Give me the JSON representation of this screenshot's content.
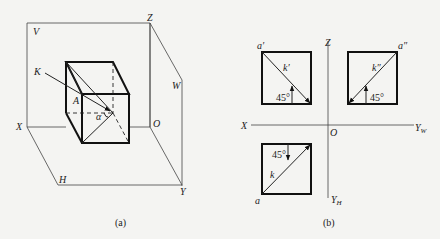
{
  "figure_a": {
    "caption": "(a)",
    "labels": {
      "V": "V",
      "Z": "Z",
      "W": "W",
      "K": "K",
      "A": "A",
      "alpha": "α",
      "X": "X",
      "O": "O",
      "H": "H",
      "Y": "Y"
    }
  },
  "figure_b": {
    "caption": "(b)",
    "axes": {
      "Z": "Z",
      "X": "X",
      "O": "O",
      "YW": "Y",
      "YW_sub": "W",
      "YH": "Y",
      "YH_sub": "H"
    },
    "front_view": {
      "point": "a′",
      "line": "k′",
      "angle": "45°"
    },
    "side_view": {
      "point": "a″",
      "line": "k″",
      "angle": "45°"
    },
    "top_view": {
      "point": "a",
      "line": "k",
      "angle": "45°"
    }
  }
}
